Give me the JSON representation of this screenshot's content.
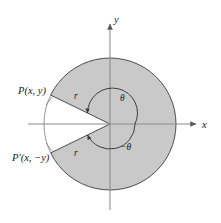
{
  "figure": {
    "background_color": "#ffffff",
    "sector_fill": "#c9c9c9",
    "wedge_fill": "#ffffff",
    "stroke_color": "#4d4d4d",
    "axis_color": "#8c8c8c",
    "text_color": "#1a1a1a"
  },
  "axes": {
    "x_label": "x",
    "y_label": "y",
    "origin": {
      "x": 110,
      "y": 124
    },
    "x_range": [
      28,
      198
    ],
    "y_range": [
      22,
      210
    ]
  },
  "circle": {
    "center": {
      "x": 110,
      "y": 124
    },
    "radius": 66,
    "wedge_half_angle_deg": 26
  },
  "labels": {
    "point_p": "P(x,  y)",
    "point_p_prime": "P'(x,  −y)",
    "radius_upper": "r",
    "radius_lower": "r",
    "angle_positive": "θ",
    "angle_negative": "−θ"
  },
  "chart_data": {
    "type": "scatter",
    "xlabel": "x",
    "ylabel": "y",
    "points": [
      {
        "name": "P(x,  y)",
        "angle_deg": 154,
        "r": 66
      },
      {
        "name": "P'(x,  −y)",
        "angle_deg": -154,
        "r": 66
      }
    ],
    "annotations": [
      {
        "text": "r",
        "describes": "radius to P"
      },
      {
        "text": "r",
        "describes": "radius to P'"
      },
      {
        "text": "θ",
        "describes": "positive angle from +x axis"
      },
      {
        "text": "−θ",
        "describes": "negative angle from +x axis"
      }
    ],
    "grid": false,
    "legend": "none"
  }
}
